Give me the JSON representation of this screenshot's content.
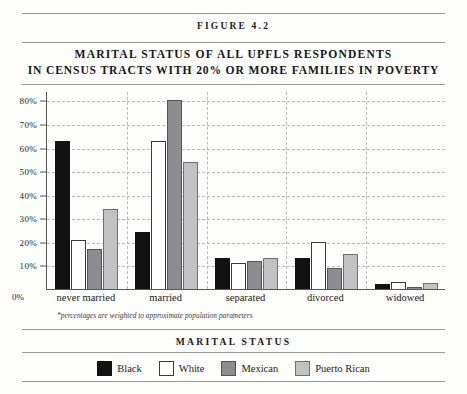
{
  "figure": {
    "number_label": "FIGURE 4.2",
    "title_line1": "MARITAL STATUS OF ALL UPFLS RESPONDENTS",
    "title_line2": "IN CENSUS TRACTS WITH 20% OR MORE FAMILIES IN POVERTY",
    "footnote": "*percentages are weighted to approximate population parameters",
    "zero_label": "0%",
    "legend_title": "MARITAL STATUS"
  },
  "chart_data": {
    "type": "bar",
    "title": "MARITAL STATUS OF ALL UPFLS RESPONDENTS IN CENSUS TRACTS WITH 20% OR MORE FAMILIES IN POVERTY",
    "xlabel": "MARITAL STATUS",
    "ylabel": "",
    "ylim": [
      0,
      84
    ],
    "grid": true,
    "legend_position": "bottom",
    "categories": [
      "never married",
      "married",
      "separated",
      "divorced",
      "widowed"
    ],
    "ytick_labels": [
      "80%",
      "70%",
      "60%",
      "50%",
      "40%",
      "30%",
      "20%",
      "10%"
    ],
    "ytick_values": [
      80,
      70,
      60,
      50,
      40,
      30,
      20,
      10
    ],
    "series": [
      {
        "name": "Black",
        "color": "#121214",
        "values": [
          63,
          24,
          13,
          13,
          2
        ]
      },
      {
        "name": "White",
        "color": "#ffffff",
        "values": [
          21,
          63,
          11,
          20,
          3
        ]
      },
      {
        "name": "Mexican",
        "color": "#8d8d91",
        "values": [
          17,
          80,
          12,
          9,
          1
        ]
      },
      {
        "name": "Puerto Rican",
        "color": "#c2c2c4",
        "values": [
          34,
          54,
          13,
          15,
          2.5
        ]
      }
    ]
  }
}
